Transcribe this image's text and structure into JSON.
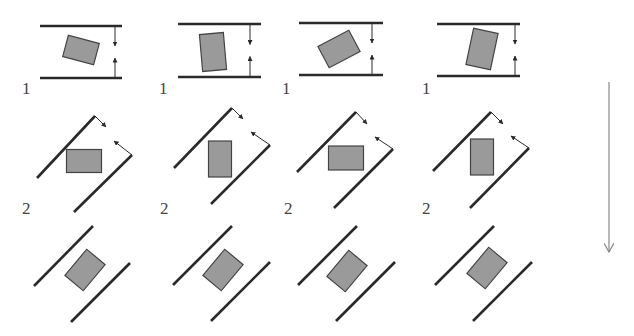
{
  "diagram": {
    "colors": {
      "line": "#2a2a2a",
      "rect_fill": "#9a9a9a",
      "rect_stroke": "#444444",
      "arrow": "#888888",
      "label": "#444444"
    },
    "row_labels": [
      {
        "text": "1",
        "x": 22,
        "y": 80
      },
      {
        "text": "1",
        "x": 159,
        "y": 80
      },
      {
        "text": "1",
        "x": 282,
        "y": 80
      },
      {
        "text": "1",
        "x": 422,
        "y": 80
      },
      {
        "text": "2",
        "x": 22,
        "y": 200
      },
      {
        "text": "2",
        "x": 160,
        "y": 200
      },
      {
        "text": "2",
        "x": 284,
        "y": 200
      },
      {
        "text": "2",
        "x": 422,
        "y": 200
      }
    ],
    "row1_panels": [
      {
        "x1": 40,
        "x2": 122,
        "ytop": 26,
        "ybot": 78,
        "arrow_x": 115,
        "rect": {
          "cx": 81,
          "cy": 50,
          "w": 32,
          "h": 22,
          "angle": 15
        }
      },
      {
        "x1": 178,
        "x2": 261,
        "ytop": 24,
        "ybot": 77,
        "arrow_x": 250,
        "rect": {
          "cx": 213,
          "cy": 52,
          "w": 24,
          "h": 37,
          "angle": -5
        }
      },
      {
        "x1": 299,
        "x2": 383,
        "ytop": 23,
        "ybot": 75,
        "arrow_x": 372,
        "rect": {
          "cx": 339,
          "cy": 49,
          "w": 35,
          "h": 24,
          "angle": -28
        }
      },
      {
        "x1": 437,
        "x2": 520,
        "ytop": 24,
        "ybot": 76,
        "arrow_x": 515,
        "rect": {
          "cx": 482,
          "cy": 49,
          "w": 25,
          "h": 37,
          "angle": 12
        }
      }
    ],
    "row2_panels": [
      {
        "lineA": [
          37,
          178,
          95,
          116
        ],
        "lineB": [
          74,
          212,
          132,
          155
        ],
        "arrowA": [
          95,
          116,
          106,
          127
        ],
        "arrowB": [
          132,
          155,
          114,
          141
        ],
        "rect": {
          "cx": 84,
          "cy": 161,
          "w": 35,
          "h": 23,
          "angle": 0
        }
      },
      {
        "lineA": [
          174,
          168,
          232,
          108
        ],
        "lineB": [
          211,
          204,
          270,
          145
        ],
        "arrowA": [
          232,
          108,
          243,
          119
        ],
        "arrowB": [
          270,
          145,
          251,
          132
        ],
        "rect": {
          "cx": 220,
          "cy": 159,
          "w": 23,
          "h": 36,
          "angle": 0
        }
      },
      {
        "lineA": [
          297,
          172,
          356,
          112
        ],
        "lineB": [
          334,
          208,
          393,
          149
        ],
        "arrowA": [
          356,
          112,
          367,
          124
        ],
        "arrowB": [
          393,
          149,
          375,
          137
        ],
        "rect": {
          "cx": 346,
          "cy": 158,
          "w": 35,
          "h": 24,
          "angle": 0
        }
      },
      {
        "lineA": [
          433,
          171,
          491,
          112
        ],
        "lineB": [
          470,
          208,
          529,
          148
        ],
        "arrowA": [
          491,
          112,
          503,
          124
        ],
        "arrowB": [
          529,
          148,
          511,
          136
        ],
        "rect": {
          "cx": 482,
          "cy": 157,
          "w": 23,
          "h": 36,
          "angle": 0
        }
      }
    ],
    "row3_panels": [
      {
        "lineA": [
          34,
          286,
          93,
          226
        ],
        "lineB": [
          71,
          322,
          130,
          263
        ],
        "rect": {
          "cx": 85,
          "cy": 270,
          "w": 34,
          "h": 24,
          "angle": -50
        }
      },
      {
        "lineA": [
          173,
          285,
          232,
          226
        ],
        "lineB": [
          211,
          321,
          270,
          262
        ],
        "rect": {
          "cx": 223,
          "cy": 270,
          "w": 34,
          "h": 24,
          "angle": -50
        }
      },
      {
        "lineA": [
          298,
          285,
          357,
          226
        ],
        "lineB": [
          336,
          321,
          395,
          262
        ],
        "rect": {
          "cx": 347,
          "cy": 271,
          "w": 34,
          "h": 24,
          "angle": -50
        }
      },
      {
        "lineA": [
          435,
          285,
          494,
          226
        ],
        "lineB": [
          473,
          321,
          532,
          262
        ],
        "rect": {
          "cx": 487,
          "cy": 268,
          "w": 34,
          "h": 24,
          "angle": -50
        }
      }
    ],
    "time_arrow": {
      "x": 609,
      "y1": 82,
      "y2": 252
    }
  }
}
